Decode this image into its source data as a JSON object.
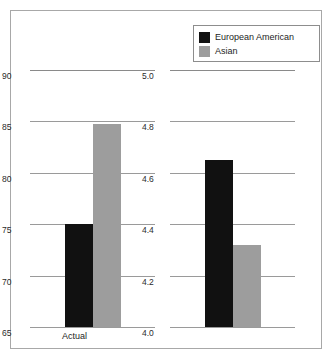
{
  "legend": {
    "items": [
      {
        "label": "European American",
        "color": "#111111",
        "icon": "legend-swatch-black"
      },
      {
        "label": "Asian",
        "color": "#9d9d9d",
        "icon": "legend-swatch-gray"
      }
    ]
  },
  "chart_data": {
    "type": "bar",
    "title": "",
    "xlabel": "",
    "ylabel": "",
    "grid": true,
    "legend_position": "top-right",
    "panels": [
      {
        "name": "Actual",
        "category": "Actual",
        "ylim": [
          65,
          90
        ],
        "ytick_step": 5,
        "yticks": [
          "90",
          "85",
          "80",
          "75",
          "70",
          "65"
        ],
        "ytick_values": [
          90,
          85,
          80,
          75,
          70,
          65
        ],
        "series": [
          {
            "name": "European American",
            "value": 75.0,
            "color": "#111111"
          },
          {
            "name": "Asian",
            "value": 84.7,
            "color": "#9d9d9d"
          }
        ]
      },
      {
        "name": "Retrospective",
        "category": "Retrospective",
        "ylim": [
          4.0,
          5.0
        ],
        "ytick_step": 0.2,
        "yticks": [
          "5.0",
          "4.8",
          "4.6",
          "4.4",
          "4.2",
          "4.0"
        ],
        "ytick_values": [
          5.0,
          4.8,
          4.6,
          4.4,
          4.2,
          4.0
        ],
        "series": [
          {
            "name": "European American",
            "value": 4.65,
            "color": "#111111"
          },
          {
            "name": "Asian",
            "value": 4.32,
            "color": "#9d9d9d"
          }
        ]
      }
    ]
  }
}
